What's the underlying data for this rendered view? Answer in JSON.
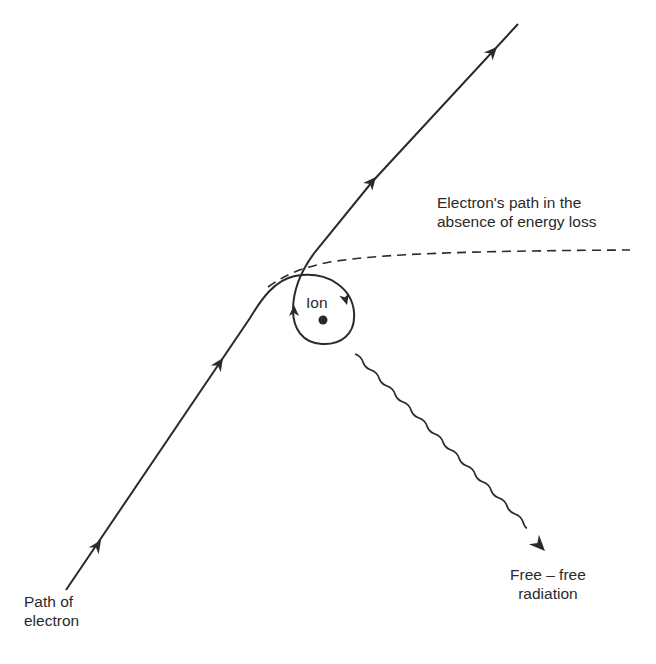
{
  "diagram": {
    "type": "physics-illustration",
    "colors": {
      "ink": "#2a2a2a",
      "background": "#ffffff"
    },
    "labels": {
      "ion": "Ion",
      "undeflected_path": {
        "line1": "Electron's path in the",
        "line2": "absence of energy loss"
      },
      "radiation": {
        "line1": "Free – free",
        "line2": "radiation"
      },
      "electron_path": {
        "line1": "Path of",
        "line2": "electron"
      }
    },
    "elements": [
      {
        "id": "electron-path",
        "style": "solid",
        "arrows": 5,
        "description": "Electron travels up-right, loops around the ion, and leaves at a steeper angle"
      },
      {
        "id": "undeflected-path",
        "style": "dashed",
        "description": "Path electron would follow without energy loss"
      },
      {
        "id": "ion",
        "shape": "dot"
      },
      {
        "id": "photon",
        "style": "wavy",
        "arrows": 1,
        "description": "Emitted free-free radiation"
      }
    ]
  }
}
